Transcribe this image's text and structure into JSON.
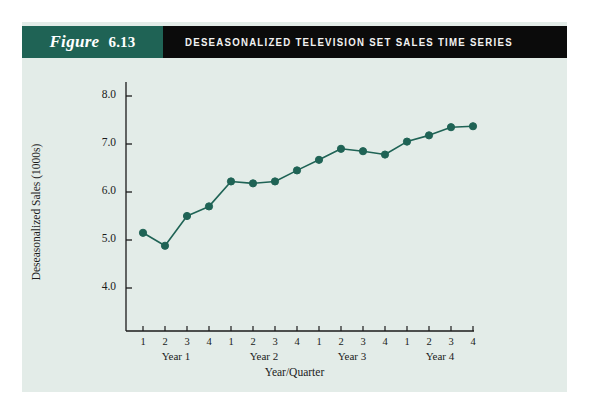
{
  "figure": {
    "label": "Figure",
    "number": "6.13",
    "title": "DESEASONALIZED TELEVISION SET SALES TIME SERIES"
  },
  "colors": {
    "banner_left": "#1f6355",
    "banner_right": "#0b0b0b",
    "panel": "#e3ece8",
    "series": "#1f6355",
    "axis": "#1b1b1b"
  },
  "chart_data": {
    "type": "line",
    "title": "DESEASONALIZED TELEVISION SET SALES TIME SERIES",
    "xlabel": "Year/Quarter",
    "ylabel": "Deseasonalized Sales (1000s)",
    "categories": [
      "1",
      "2",
      "3",
      "4",
      "1",
      "2",
      "3",
      "4",
      "1",
      "2",
      "3",
      "4",
      "1",
      "2",
      "3",
      "4"
    ],
    "group_labels": [
      "Year 1",
      "Year 2",
      "Year 3",
      "Year 4"
    ],
    "values": [
      5.15,
      4.88,
      5.5,
      5.7,
      6.22,
      6.18,
      6.22,
      6.45,
      6.67,
      6.9,
      6.85,
      6.78,
      7.05,
      7.18,
      7.35,
      7.37
    ],
    "ytick_labels": [
      "8.0",
      "7.0",
      "6.0",
      "5.0",
      "4.0"
    ],
    "yticks": [
      8.0,
      7.0,
      6.0,
      5.0,
      4.0
    ],
    "ylim": [
      3.5,
      8.3
    ],
    "xlim": [
      0.5,
      16.5
    ],
    "grid": false,
    "legend": null,
    "markers": true,
    "marker_shape": "circle"
  }
}
